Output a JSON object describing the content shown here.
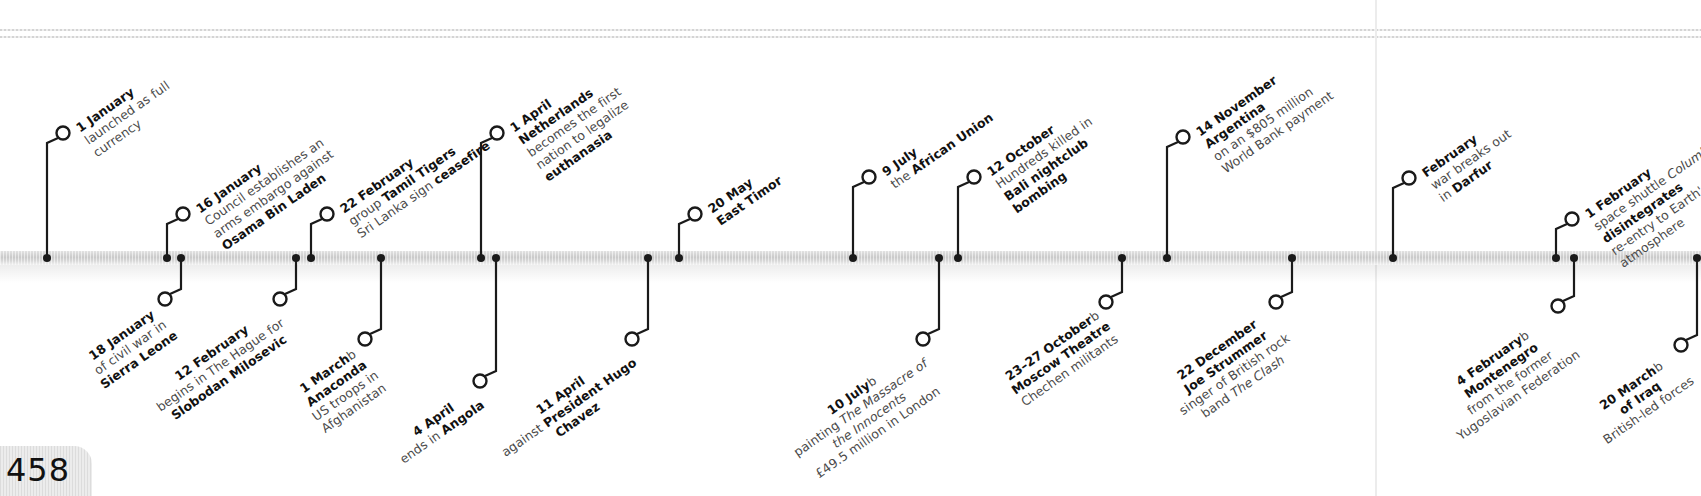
{
  "page": {
    "number": "458"
  },
  "timeline": {
    "above": [
      {
        "x": 47,
        "cx": 63,
        "cy": 133,
        "lines": [
          [
            "b",
            "1 January",
            " Euro"
          ],
          [
            "",
            "launched as full"
          ],
          [
            "",
            "currency"
          ]
        ]
      },
      {
        "x": 167,
        "cx": 183,
        "cy": 214,
        "lines": [
          [
            "b",
            "16 January",
            " UN Security"
          ],
          [
            "",
            "Council establishes an"
          ],
          [
            "",
            "arms embargo against"
          ],
          [
            "b",
            "Osama Bin Laden"
          ]
        ]
      },
      {
        "x": 311,
        "cx": 327,
        "cy": 214,
        "lines": [
          [
            "b",
            "22 February",
            " Separatist"
          ],
          [
            "",
            "group ",
            "b",
            "Tamil Tigers",
            " and"
          ],
          [
            "",
            "Sri Lanka sign ",
            "b",
            "ceasefire"
          ]
        ]
      },
      {
        "x": 481,
        "cx": 497,
        "cy": 133,
        "lines": [
          [
            "b",
            "1 April",
            " The"
          ],
          [
            "b",
            "Netherlands"
          ],
          [
            "",
            "becomes the first"
          ],
          [
            "",
            "nation to legalize"
          ],
          [
            "b",
            "euthanasia"
          ]
        ]
      },
      {
        "x": 679,
        "cx": 695,
        "cy": 214,
        "lines": [
          [
            "b",
            "20 May",
            " Independence of"
          ],
          [
            "b",
            "East Timor",
            " recognized by Portugal"
          ]
        ]
      },
      {
        "x": 853,
        "cx": 869,
        "cy": 177,
        "lines": [
          [
            "b",
            "9 July",
            " Launch of"
          ],
          [
            "",
            "the ",
            "b",
            "African Union"
          ]
        ]
      },
      {
        "x": 958,
        "cx": 974,
        "cy": 177,
        "lines": [
          [
            "b",
            "12 October"
          ],
          [
            "",
            "Hundreds killed in"
          ],
          [
            "b",
            "Bali nightclub"
          ],
          [
            "b",
            "bombing"
          ]
        ]
      },
      {
        "x": 1167,
        "cx": 1183,
        "cy": 137,
        "lines": [
          [
            "b",
            "14 November"
          ],
          [
            "b",
            "Argentina",
            " defaults"
          ],
          [
            "",
            "on an $805 million"
          ],
          [
            "",
            "World Bank payment"
          ]
        ]
      },
      {
        "x": 1393,
        "cx": 1409,
        "cy": 178,
        "lines": [
          [
            "b",
            "February",
            " Civil"
          ],
          [
            "",
            "war breaks out"
          ],
          [
            "",
            "in ",
            "b",
            "Darfur",
            ", Sudan"
          ]
        ]
      },
      {
        "x": 1556,
        "cx": 1572,
        "cy": 219,
        "lines": [
          [
            "b",
            "1 February",
            " US"
          ],
          [
            "",
            "space shuttle ",
            "i",
            "Columbia"
          ],
          [
            "b",
            "disintegrates",
            " upon"
          ],
          [
            "",
            "re-entry to Earth's"
          ],
          [
            "",
            "atmosphere"
          ]
        ]
      }
    ],
    "below": [
      {
        "x": 181,
        "cx": 165,
        "cy": 299,
        "lines": [
          [
            "b",
            "18 January",
            " End"
          ],
          [
            "",
            "of civil war in"
          ],
          [
            "b",
            "Sierra Leone"
          ]
        ]
      },
      {
        "x": 296,
        "cx": 280,
        "cy": 299,
        "lines": [
          [
            "b",
            "12 February",
            " Trial"
          ],
          [
            "",
            "begins in The Hague for"
          ],
          [
            "b",
            "Slobodan Milosevic"
          ]
        ]
      },
      {
        "x": 381,
        "cx": 365,
        "cy": 339,
        "lines": [
          [
            "b",
            "1 March",
            " ",
            "b",
            "Operation"
          ],
          [
            "b",
            "Anaconda",
            " launched by"
          ],
          [
            "",
            "US troops in"
          ],
          [
            "",
            "Afghanistan"
          ]
        ]
      },
      {
        "x": 496,
        "cx": 480,
        "cy": 381,
        "lines": [
          [
            "b",
            "4 April",
            " Civil War"
          ],
          [
            "",
            "ends in ",
            "b",
            "Angola"
          ]
        ]
      },
      {
        "x": 648,
        "cx": 632,
        "cy": 339,
        "lines": [
          [
            "b",
            "11 April",
            " Attempted coup"
          ],
          [
            "",
            "against ",
            "b",
            "President Hugo"
          ],
          [
            "b",
            "Chavez",
            " of Venezuela"
          ]
        ]
      },
      {
        "x": 939,
        "cx": 923,
        "cy": 339,
        "lines": [
          [
            "b",
            "10 July",
            " Peter Paul ",
            "b",
            "Rubens'"
          ],
          [
            "",
            "painting ",
            "i",
            "The Massacre of"
          ],
          [
            "i",
            "the Innocents",
            " sold for"
          ],
          [
            "",
            "£49.5 million in London"
          ]
        ]
      },
      {
        "x": 1122,
        "cx": 1106,
        "cy": 302,
        "lines": [
          [
            "b",
            "23–27 October",
            " ",
            "b",
            "Siege of"
          ],
          [
            "b",
            "Moscow Theatre",
            " by"
          ],
          [
            "",
            "Chechen militants"
          ]
        ]
      },
      {
        "x": 1292,
        "cx": 1276,
        "cy": 302,
        "lines": [
          [
            "b",
            "22 December",
            " Death of"
          ],
          [
            "b",
            "Joe Strummer",
            ", lead"
          ],
          [
            "",
            "singer of British rock"
          ],
          [
            "",
            "band ",
            "i",
            "The Clash",
            " (b.1952)"
          ]
        ]
      },
      {
        "x": 1574,
        "cx": 1558,
        "cy": 306,
        "lines": [
          [
            "b",
            "4 February",
            " ",
            "b",
            "Serbia and"
          ],
          [
            "b",
            "Montenegro",
            " emerge"
          ],
          [
            "",
            "from the former"
          ],
          [
            "",
            "Yugoslavian Federation"
          ]
        ]
      },
      {
        "x": 1697,
        "cx": 1681,
        "cy": 345,
        "lines": [
          [
            "b",
            "20 March",
            " ",
            "b",
            "Invasion"
          ],
          [
            "b",
            "of Iraq",
            " by US- and"
          ],
          [
            "",
            "British-led forces"
          ]
        ]
      }
    ]
  }
}
